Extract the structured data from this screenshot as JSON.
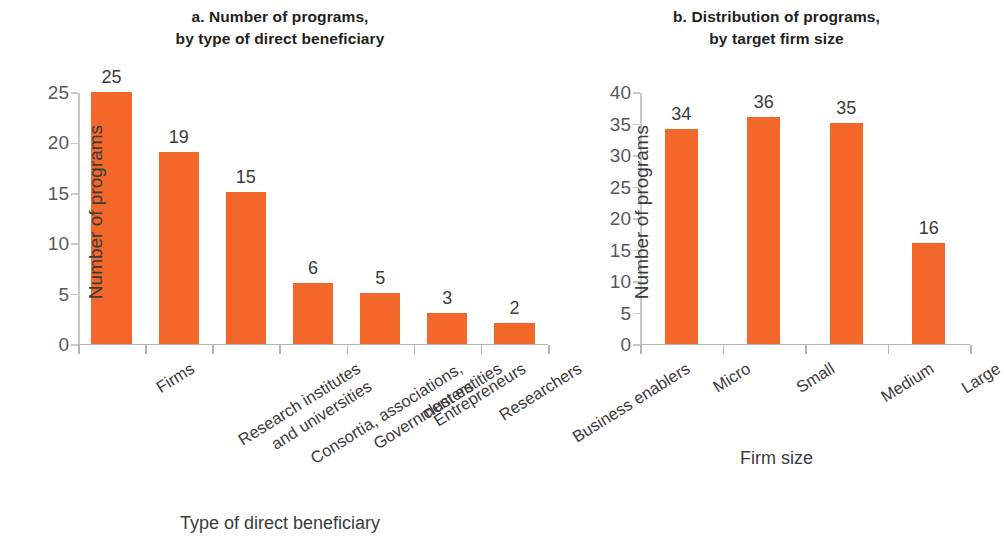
{
  "figure": {
    "background": "#ffffff",
    "bar_color": "#f4672b",
    "axis_color": "#b4b4b4",
    "text_color": "#3b3b3b"
  },
  "chart_data": [
    {
      "type": "bar",
      "panel": "a",
      "title_line1": "a. Number of programs,",
      "title_line2": "by type of direct beneficiary",
      "title": "a. Number of programs, by type of direct beneficiary",
      "categories": [
        "Firms",
        "Research institutes and universities",
        "Consortia, associations, clusters",
        "Government entities",
        "Entrepreneurs",
        "Researchers",
        "Business enablers"
      ],
      "category_lines": [
        [
          "Firms"
        ],
        [
          "Research institutes",
          "and universities"
        ],
        [
          "Consortia, associations,",
          "clusters"
        ],
        [
          "Government entities"
        ],
        [
          "Entrepreneurs"
        ],
        [
          "Researchers"
        ],
        [
          "Business enablers"
        ]
      ],
      "values": [
        25,
        19,
        15,
        6,
        5,
        3,
        2
      ],
      "xlabel": "Type of direct beneficiary",
      "ylabel": "Number of programs",
      "ylim": [
        0,
        25
      ],
      "yticks": [
        0,
        5,
        10,
        15,
        20,
        25
      ],
      "grid": false,
      "legend": "none",
      "value_labels": true
    },
    {
      "type": "bar",
      "panel": "b",
      "title_line1": "b. Distribution of programs,",
      "title_line2": "by target firm size",
      "title": "b. Distribution of programs, by target firm size",
      "categories": [
        "Micro",
        "Small",
        "Medium",
        "Large"
      ],
      "category_lines": [
        [
          "Micro"
        ],
        [
          "Small"
        ],
        [
          "Medium"
        ],
        [
          "Large"
        ]
      ],
      "values": [
        34,
        36,
        35,
        16
      ],
      "xlabel": "Firm size",
      "ylabel": "Number of programs",
      "ylim": [
        0,
        40
      ],
      "yticks": [
        0,
        5,
        10,
        15,
        20,
        25,
        30,
        35,
        40
      ],
      "grid": false,
      "legend": "none",
      "value_labels": true
    }
  ]
}
